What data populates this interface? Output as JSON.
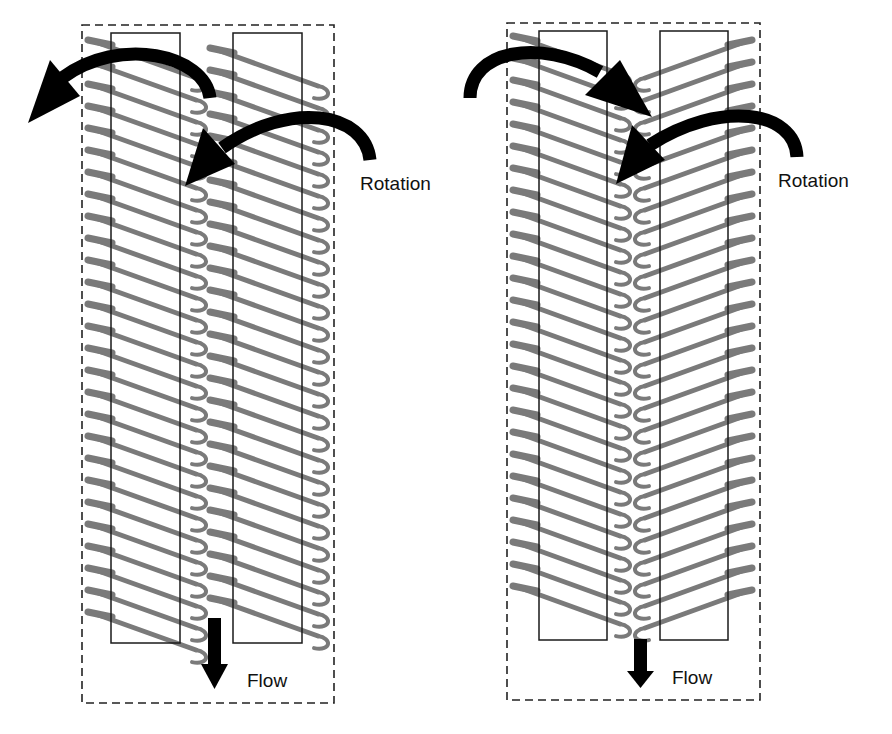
{
  "figure": {
    "panels": [
      {
        "id": "left",
        "configuration": "co-rotating",
        "rotation_label": "Rotation",
        "flow_label": "Flow"
      },
      {
        "id": "right",
        "configuration": "counter-rotating",
        "rotation_label": "Rotation",
        "flow_label": "Flow"
      }
    ]
  },
  "colors": {
    "flight": "#7a7a7a",
    "arrow": "#000000",
    "box_outline": "#1a1a1a",
    "background": "#ffffff"
  },
  "icons": {
    "rotation_arrow": "curved-arrow-icon",
    "flow_arrow": "arrow-down-icon"
  }
}
